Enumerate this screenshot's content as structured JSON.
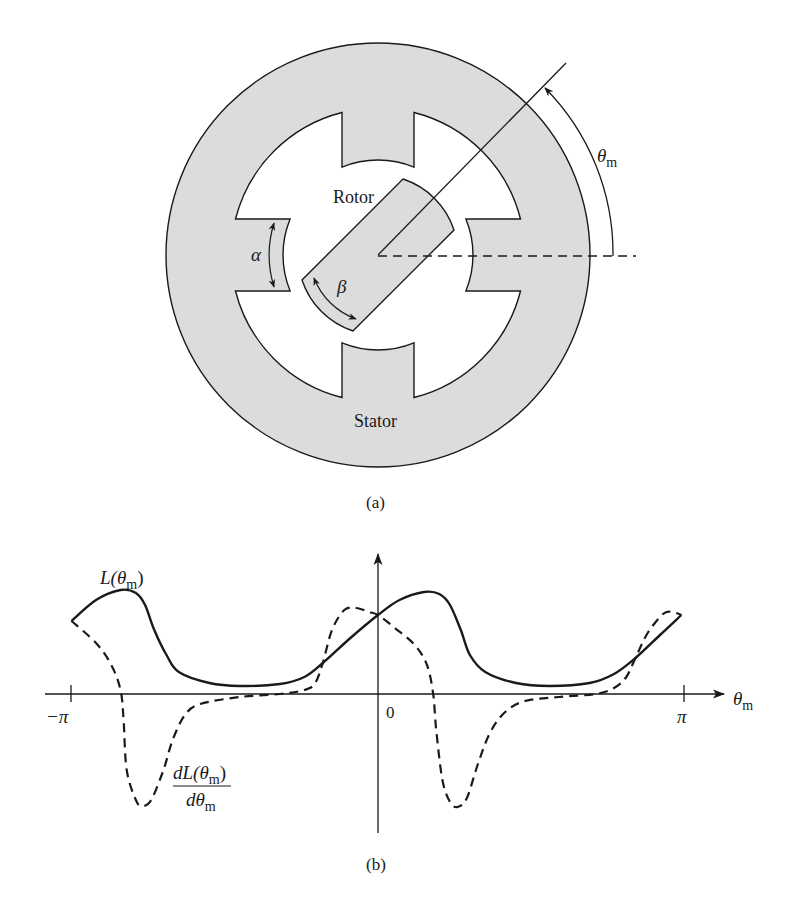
{
  "figure_a": {
    "caption": "(a)",
    "labels": {
      "rotor": "Rotor",
      "stator": "Stator",
      "alpha": "α",
      "beta": "β",
      "theta": "θ",
      "theta_sub": "m"
    },
    "colors": {
      "iron_fill": "#dcdcdc",
      "line": "#1a1a1a",
      "background": "#ffffff"
    }
  },
  "figure_b": {
    "caption": "(b)",
    "labels": {
      "L_main": "L(θ",
      "L_sub": "m",
      "L_close": ")",
      "dL_num_main": "dL(θ",
      "dL_num_sub": "m",
      "dL_num_close": ")",
      "dL_den_main": "dθ",
      "dL_den_sub": "m",
      "x_axis_main": "θ",
      "x_axis_sub": "m",
      "tick_neg_pi": "−π",
      "tick_zero": "0",
      "tick_pi": "π"
    }
  },
  "chart_data": {
    "type": "line",
    "title": "",
    "xlabel": "θm",
    "ylabel": "",
    "x_units": "multiples of π",
    "xlim": [
      -1,
      1
    ],
    "x_ticks": [
      {
        "value": -1,
        "label": "−π"
      },
      {
        "value": 0,
        "label": "0"
      },
      {
        "value": 1,
        "label": "π"
      }
    ],
    "grid": false,
    "series": [
      {
        "name": "L(θm)",
        "style": "solid",
        "points": [
          [
            -1.0,
            0.73
          ],
          [
            -0.92,
            0.94
          ],
          [
            -0.84,
            1.04
          ],
          [
            -0.79,
            1.01
          ],
          [
            -0.76,
            0.89
          ],
          [
            -0.73,
            0.64
          ],
          [
            -0.69,
            0.39
          ],
          [
            -0.65,
            0.22
          ],
          [
            -0.55,
            0.11
          ],
          [
            -0.45,
            0.08
          ],
          [
            -0.32,
            0.1
          ],
          [
            -0.24,
            0.17
          ],
          [
            -0.18,
            0.31
          ],
          [
            -0.09,
            0.56
          ],
          [
            0.0,
            0.79
          ],
          [
            0.07,
            0.94
          ],
          [
            0.15,
            1.02
          ],
          [
            0.2,
            1.0
          ],
          [
            0.235,
            0.89
          ],
          [
            0.27,
            0.64
          ],
          [
            0.3,
            0.39
          ],
          [
            0.35,
            0.22
          ],
          [
            0.45,
            0.11
          ],
          [
            0.56,
            0.08
          ],
          [
            0.69,
            0.11
          ],
          [
            0.77,
            0.2
          ],
          [
            0.84,
            0.36
          ],
          [
            0.92,
            0.59
          ],
          [
            0.99,
            0.79
          ]
        ]
      },
      {
        "name": "dL(θm)/dθm",
        "style": "dashed",
        "points": [
          [
            -1.0,
            0.73
          ],
          [
            -0.92,
            0.51
          ],
          [
            -0.87,
            0.29
          ],
          [
            -0.84,
            0.04
          ],
          [
            -0.83,
            -0.26
          ],
          [
            -0.82,
            -0.76
          ],
          [
            -0.79,
            -1.06
          ],
          [
            -0.77,
            -1.12
          ],
          [
            -0.74,
            -1.06
          ],
          [
            -0.7,
            -0.76
          ],
          [
            -0.67,
            -0.46
          ],
          [
            -0.63,
            -0.21
          ],
          [
            -0.58,
            -0.1
          ],
          [
            -0.45,
            -0.03
          ],
          [
            -0.32,
            0.0
          ],
          [
            -0.24,
            0.04
          ],
          [
            -0.205,
            0.11
          ],
          [
            -0.18,
            0.31
          ],
          [
            -0.15,
            0.64
          ],
          [
            -0.11,
            0.84
          ],
          [
            -0.07,
            0.86
          ],
          [
            -0.03,
            0.82
          ],
          [
            0.0,
            0.79
          ],
          [
            0.055,
            0.66
          ],
          [
            0.12,
            0.49
          ],
          [
            0.16,
            0.29
          ],
          [
            0.18,
            0.0
          ],
          [
            0.19,
            -0.36
          ],
          [
            0.21,
            -0.86
          ],
          [
            0.235,
            -1.08
          ],
          [
            0.26,
            -1.13
          ],
          [
            0.29,
            -1.04
          ],
          [
            0.325,
            -0.71
          ],
          [
            0.365,
            -0.39
          ],
          [
            0.415,
            -0.18
          ],
          [
            0.48,
            -0.07
          ],
          [
            0.59,
            -0.03
          ],
          [
            0.71,
            0.0
          ],
          [
            0.77,
            0.06
          ],
          [
            0.81,
            0.17
          ],
          [
            0.84,
            0.36
          ],
          [
            0.88,
            0.61
          ],
          [
            0.93,
            0.8
          ],
          [
            0.96,
            0.82
          ],
          [
            0.99,
            0.79
          ]
        ]
      }
    ]
  }
}
